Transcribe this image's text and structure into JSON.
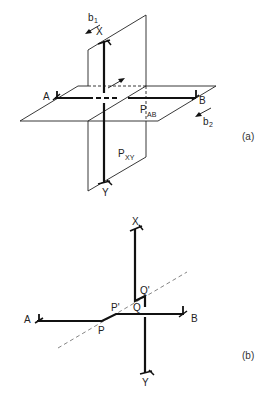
{
  "figure": {
    "panel_a": {
      "caption": "(a)",
      "labels": {
        "X": "X",
        "Y": "Y",
        "A": "A",
        "B": "B",
        "plane_ab": "P",
        "plane_ab_sub": "AB",
        "plane_xy": "P",
        "plane_xy_sub": "XY",
        "b1": "b",
        "b1_sub": "1",
        "b2": "b",
        "b2_sub": "2"
      }
    },
    "panel_b": {
      "caption": "(b)",
      "labels": {
        "X": "X",
        "Y": "Y",
        "A": "A",
        "B": "B",
        "P": "P",
        "P_prime": "P'",
        "Q": "Q",
        "Q_prime": "Q'"
      }
    },
    "colors": {
      "line": "#111111",
      "thin": "#222222",
      "dashed": "#666666",
      "background": "#ffffff"
    }
  }
}
